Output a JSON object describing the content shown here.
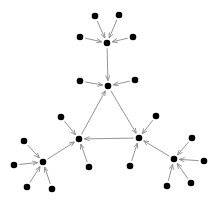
{
  "diagram": {
    "type": "directed-graph",
    "node_color": "#000000",
    "edge_color": "#888888",
    "nodes": [
      {
        "id": "top-hub",
        "x": 107,
        "y": 43
      },
      {
        "id": "t1",
        "x": 95,
        "y": 16
      },
      {
        "id": "t2",
        "x": 119,
        "y": 15
      },
      {
        "id": "t3",
        "x": 80,
        "y": 37
      },
      {
        "id": "t4",
        "x": 133,
        "y": 37
      },
      {
        "id": "apex",
        "x": 108,
        "y": 86
      },
      {
        "id": "a1",
        "x": 80,
        "y": 81
      },
      {
        "id": "a2",
        "x": 135,
        "y": 80
      },
      {
        "id": "left",
        "x": 79,
        "y": 139
      },
      {
        "id": "l1",
        "x": 61,
        "y": 117
      },
      {
        "id": "l2",
        "x": 89,
        "y": 167
      },
      {
        "id": "right",
        "x": 139,
        "y": 138
      },
      {
        "id": "r1",
        "x": 156,
        "y": 116
      },
      {
        "id": "r2",
        "x": 130,
        "y": 166
      },
      {
        "id": "bl-hub",
        "x": 43,
        "y": 162
      },
      {
        "id": "b1",
        "x": 24,
        "y": 141
      },
      {
        "id": "b2",
        "x": 14,
        "y": 165
      },
      {
        "id": "b3",
        "x": 27,
        "y": 187
      },
      {
        "id": "b4",
        "x": 52,
        "y": 189
      },
      {
        "id": "br-hub",
        "x": 174,
        "y": 159
      },
      {
        "id": "c1",
        "x": 192,
        "y": 138
      },
      {
        "id": "c2",
        "x": 204,
        "y": 161
      },
      {
        "id": "c3",
        "x": 191,
        "y": 183
      },
      {
        "id": "c4",
        "x": 167,
        "y": 186
      }
    ],
    "edges": [
      [
        "t1",
        "top-hub"
      ],
      [
        "t2",
        "top-hub"
      ],
      [
        "t3",
        "top-hub"
      ],
      [
        "t4",
        "top-hub"
      ],
      [
        "top-hub",
        "apex"
      ],
      [
        "a1",
        "apex"
      ],
      [
        "a2",
        "apex"
      ],
      [
        "left",
        "apex"
      ],
      [
        "apex",
        "right"
      ],
      [
        "right",
        "left"
      ],
      [
        "l1",
        "left"
      ],
      [
        "l2",
        "left"
      ],
      [
        "r1",
        "right"
      ],
      [
        "r2",
        "right"
      ],
      [
        "bl-hub",
        "left"
      ],
      [
        "b1",
        "bl-hub"
      ],
      [
        "b2",
        "bl-hub"
      ],
      [
        "b3",
        "bl-hub"
      ],
      [
        "b4",
        "bl-hub"
      ],
      [
        "br-hub",
        "right"
      ],
      [
        "c1",
        "br-hub"
      ],
      [
        "c2",
        "br-hub"
      ],
      [
        "c3",
        "br-hub"
      ],
      [
        "c4",
        "br-hub"
      ]
    ]
  }
}
